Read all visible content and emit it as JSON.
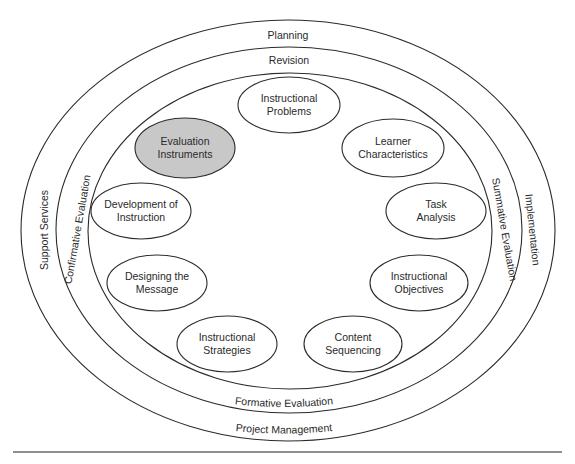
{
  "diagram": {
    "type": "concentric-ellipse model",
    "colors": {
      "line": "#2b2b2b",
      "text": "#2a2a2a",
      "node_fill": "#ffffff",
      "highlight_fill": "#c8c8c8",
      "rule": "#6a6a6a"
    },
    "rings": {
      "outer": {
        "top_label": "Planning",
        "left_label": "Support Services",
        "right_label": "Implementation",
        "bottom_label": "Project Management"
      },
      "middle": {
        "top_label": "Revision",
        "left_label": "Confirmative Evaluation",
        "right_label": "Summative Evaluation",
        "bottom_label": "Formative Evaluation"
      }
    },
    "nodes": [
      {
        "id": "instructional-problems",
        "line1": "Instructional",
        "line2": "Problems",
        "highlighted": false
      },
      {
        "id": "learner-characteristics",
        "line1": "Learner",
        "line2": "Characteristics",
        "highlighted": false
      },
      {
        "id": "task-analysis",
        "line1": "Task",
        "line2": "Analysis",
        "highlighted": false
      },
      {
        "id": "instructional-objectives",
        "line1": "Instructional",
        "line2": "Objectives",
        "highlighted": false
      },
      {
        "id": "content-sequencing",
        "line1": "Content",
        "line2": "Sequencing",
        "highlighted": false
      },
      {
        "id": "instructional-strategies",
        "line1": "Instructional",
        "line2": "Strategies",
        "highlighted": false
      },
      {
        "id": "designing-the-message",
        "line1": "Designing the",
        "line2": "Message",
        "highlighted": false
      },
      {
        "id": "development-of-instruction",
        "line1": "Development of",
        "line2": "Instruction",
        "highlighted": false
      },
      {
        "id": "evaluation-instruments",
        "line1": "Evaluation",
        "line2": "Instruments",
        "highlighted": true
      }
    ]
  }
}
